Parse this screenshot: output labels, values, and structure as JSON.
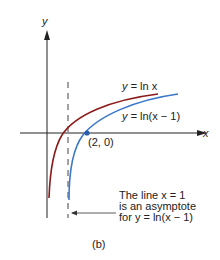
{
  "figure": {
    "caption": "(b)",
    "axes": {
      "x_label": "x",
      "y_label": "y"
    },
    "curves": [
      {
        "name": "ln-x",
        "label_prefix": "y = ",
        "label_expr": "ln x",
        "color": "#8b1a1a"
      },
      {
        "name": "ln-x-minus-1",
        "label_prefix": "y = ",
        "label_expr": "ln(x − 1)",
        "color": "#3a78c8"
      }
    ],
    "point": {
      "label": "(2, 0)",
      "color": "#2a5db0"
    },
    "annotation": {
      "line1": "The line x = 1",
      "line2": "is an asymptote",
      "line3": "for y = ln(x − 1)"
    }
  }
}
